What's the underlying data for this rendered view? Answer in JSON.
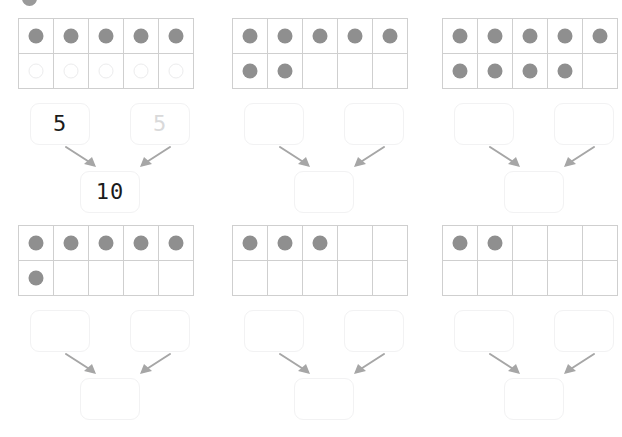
{
  "page": {
    "background_color": "#ffffff",
    "dot_color": "#8f8f8f",
    "hint_color": "#d9d9da",
    "grid_color": "#cfcfcf",
    "box_border_color": "#f2f2f3",
    "arrow_color": "#a6a6a6",
    "text_color": "#1b1b1b"
  },
  "decorations": {
    "top_cut_dot": {
      "visible": true,
      "label": "partial-dot-cut-off-top-edge"
    }
  },
  "layout": {
    "columns": 3,
    "rows": 2,
    "tenframe_rows": 2,
    "tenframe_columns": 5
  },
  "exercises": [
    {
      "id": "exercise-1",
      "position": {
        "column": 1,
        "row": 1
      },
      "tenframe": {
        "top_row": [
          "filled",
          "filled",
          "filled",
          "filled",
          "filled"
        ],
        "bottom_row": [
          "hint",
          "hint",
          "hint",
          "hint",
          "hint"
        ],
        "top_count": 5,
        "bottom_count": 0,
        "hint_count": 5,
        "total": 5
      },
      "bond": {
        "addend_left": {
          "value": "5",
          "state": "answered"
        },
        "addend_right": {
          "value": "5",
          "state": "hint"
        },
        "sum": {
          "value": "10",
          "state": "answered"
        }
      }
    },
    {
      "id": "exercise-2",
      "position": {
        "column": 2,
        "row": 1
      },
      "tenframe": {
        "top_row": [
          "filled",
          "filled",
          "filled",
          "filled",
          "filled"
        ],
        "bottom_row": [
          "filled",
          "filled",
          "empty",
          "empty",
          "empty"
        ],
        "top_count": 5,
        "bottom_count": 2,
        "hint_count": 0,
        "total": 7
      },
      "bond": {
        "addend_left": {
          "value": "",
          "state": "empty"
        },
        "addend_right": {
          "value": "",
          "state": "empty"
        },
        "sum": {
          "value": "",
          "state": "empty"
        }
      }
    },
    {
      "id": "exercise-3",
      "position": {
        "column": 3,
        "row": 1
      },
      "tenframe": {
        "top_row": [
          "filled",
          "filled",
          "filled",
          "filled",
          "filled"
        ],
        "bottom_row": [
          "filled",
          "filled",
          "filled",
          "filled",
          "empty"
        ],
        "top_count": 5,
        "bottom_count": 4,
        "hint_count": 0,
        "total": 9
      },
      "bond": {
        "addend_left": {
          "value": "",
          "state": "empty"
        },
        "addend_right": {
          "value": "",
          "state": "empty"
        },
        "sum": {
          "value": "",
          "state": "empty"
        }
      }
    },
    {
      "id": "exercise-4",
      "position": {
        "column": 1,
        "row": 2
      },
      "tenframe": {
        "top_row": [
          "filled",
          "filled",
          "filled",
          "filled",
          "filled"
        ],
        "bottom_row": [
          "filled",
          "empty",
          "empty",
          "empty",
          "empty"
        ],
        "top_count": 5,
        "bottom_count": 1,
        "hint_count": 0,
        "total": 6
      },
      "bond": {
        "addend_left": {
          "value": "",
          "state": "empty"
        },
        "addend_right": {
          "value": "",
          "state": "empty"
        },
        "sum": {
          "value": "",
          "state": "empty"
        }
      }
    },
    {
      "id": "exercise-5",
      "position": {
        "column": 2,
        "row": 2
      },
      "tenframe": {
        "top_row": [
          "filled",
          "filled",
          "filled",
          "empty",
          "empty"
        ],
        "bottom_row": [
          "empty",
          "empty",
          "empty",
          "empty",
          "empty"
        ],
        "top_count": 3,
        "bottom_count": 0,
        "hint_count": 0,
        "total": 3
      },
      "bond": {
        "addend_left": {
          "value": "",
          "state": "empty"
        },
        "addend_right": {
          "value": "",
          "state": "empty"
        },
        "sum": {
          "value": "",
          "state": "empty"
        }
      }
    },
    {
      "id": "exercise-6",
      "position": {
        "column": 3,
        "row": 2
      },
      "tenframe": {
        "top_row": [
          "filled",
          "filled",
          "empty",
          "empty",
          "empty"
        ],
        "bottom_row": [
          "empty",
          "empty",
          "empty",
          "empty",
          "empty"
        ],
        "top_count": 2,
        "bottom_count": 0,
        "hint_count": 0,
        "total": 2
      },
      "bond": {
        "addend_left": {
          "value": "",
          "state": "empty"
        },
        "addend_right": {
          "value": "",
          "state": "empty"
        },
        "sum": {
          "value": "",
          "state": "empty"
        }
      }
    }
  ]
}
